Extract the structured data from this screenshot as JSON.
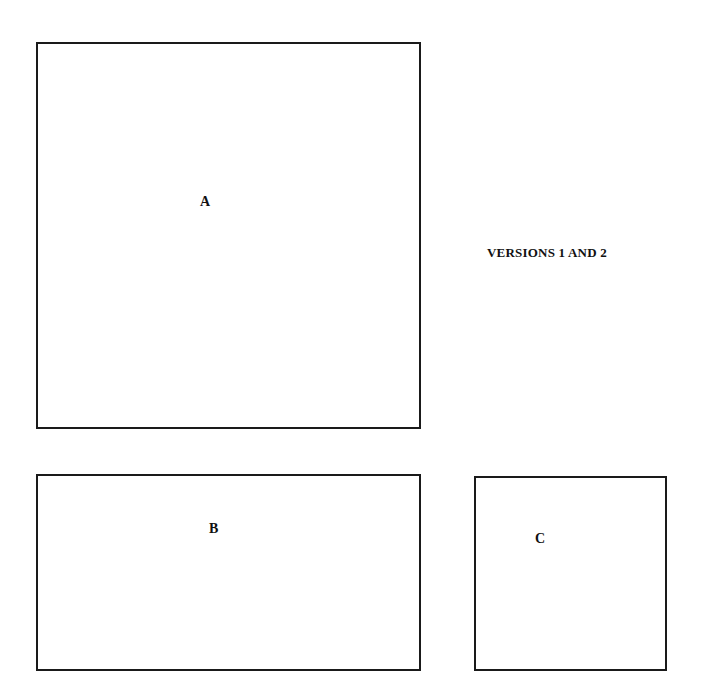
{
  "title": "VERSIONS 1 AND 2",
  "boxes": [
    {
      "id": "A",
      "label": "A"
    },
    {
      "id": "B",
      "label": "B"
    },
    {
      "id": "C",
      "label": "C"
    }
  ],
  "colors": {
    "line": "#1a1a1a",
    "background": "#ffffff"
  }
}
